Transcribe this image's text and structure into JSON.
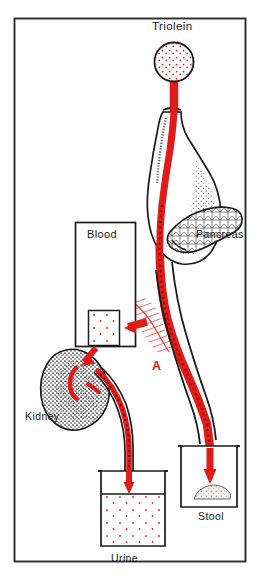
{
  "figure": {
    "title_visible": false,
    "frame": {
      "x": 14,
      "y": 18,
      "width": 232,
      "height": 544,
      "border_color": "#2b2b2b"
    },
    "background_color": "#ffffff",
    "accent_color": "#e01b18",
    "ink_color": "#1a1a1a"
  },
  "labels": {
    "triolein": "Triolein",
    "pancreas": "Pancreas",
    "blood": "Blood",
    "kidney": "Kidney",
    "urine": "Urine",
    "stool": "Stool",
    "marker_a": "A"
  },
  "elements": {
    "triolein_source": {
      "name": "triolein-circle",
      "shape": "circle",
      "fill": "white",
      "stipple_color": "#e01b18",
      "cx": 174,
      "cy": 62,
      "r": 20
    },
    "tracer_tube": {
      "name": "tracer-tube",
      "color": "#e01b18",
      "description": "red labeled-fat tracer path from triolein through stomach, duodenum and intestine"
    },
    "stomach": {
      "name": "stomach-organ",
      "fill": "white",
      "outline": "#1a1a1a",
      "texture": "stipple"
    },
    "pancreas_organ": {
      "name": "pancreas-organ",
      "fill": "white",
      "outline": "#1a1a1a",
      "texture": "cobblestone"
    },
    "blood_box": {
      "name": "blood-compartment-box",
      "x": 75,
      "y": 222,
      "width": 60,
      "height": 124,
      "fill": "white",
      "outline": "#1a1a1a"
    },
    "blood_sample": {
      "name": "blood-sample-box",
      "x": 88,
      "y": 310,
      "width": 32,
      "height": 36,
      "fill": "white",
      "stipple_color": "#e01b18"
    },
    "absorption_zone": {
      "name": "absorption-hatch-zone",
      "color": "#e01b18",
      "style": "diagonal hatch",
      "marker": "A"
    },
    "kidney_organ": {
      "name": "kidney-organ",
      "fill": "dark stipple",
      "outline": "#1a1a1a"
    },
    "ureter": {
      "name": "ureter-tube",
      "color": "#e01b18"
    },
    "urine_beaker": {
      "name": "urine-beaker",
      "x": 100,
      "y": 470,
      "width": 66,
      "height": 78,
      "liquid_level": 494,
      "dot_color": "#e01b18"
    },
    "stool_beaker": {
      "name": "stool-beaker",
      "x": 181,
      "y": 445,
      "width": 56,
      "height": 62,
      "mound_color": "#d8d8d8"
    },
    "arrows": [
      {
        "name": "arrow-into-blood-sample",
        "direction": "left",
        "color": "#e01b18"
      },
      {
        "name": "arrow-into-kidney",
        "direction": "down-left",
        "color": "#e01b18"
      },
      {
        "name": "arrow-into-urine",
        "direction": "down",
        "color": "#e01b18"
      },
      {
        "name": "arrow-into-stool",
        "direction": "down",
        "color": "#e01b18"
      }
    ]
  }
}
